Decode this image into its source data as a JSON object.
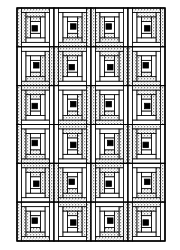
{
  "figure": {
    "colors": {
      "background": "#ffffff",
      "line": "#000000",
      "stipple_fill": "#d9d9d9",
      "plain_fill": "#ffffff",
      "center_fill": "#000000"
    },
    "bounds": {
      "x": 17,
      "y": 8,
      "width": 148,
      "height": 233
    },
    "grid": {
      "columns": 4,
      "rows": 6
    },
    "rings_per_block": 3,
    "blocks": [
      [
        "TL",
        "RB",
        "LB",
        "TR"
      ],
      [
        "RB",
        "TL",
        "TR",
        "LB"
      ],
      [
        "TL",
        "RB",
        "LB",
        "TR"
      ],
      [
        "LB",
        "TR",
        "RB",
        "TL"
      ],
      [
        "TR",
        "LB",
        "TL",
        "RB"
      ],
      [
        "LB",
        "TR",
        "RB",
        "TL"
      ]
    ]
  }
}
